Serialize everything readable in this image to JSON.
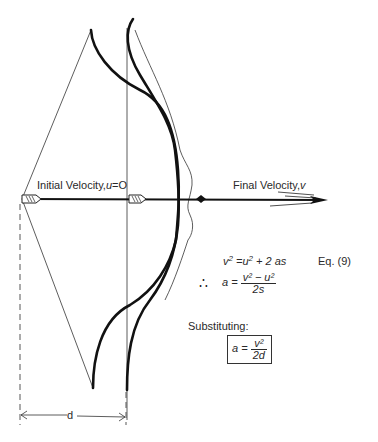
{
  "labels": {
    "initial_velocity": "Initial Velocity,",
    "initial_velocity_symbol": "u",
    "initial_velocity_value": "=O",
    "final_velocity": "Final Velocity,",
    "final_velocity_symbol": "v",
    "distance": "d",
    "substituting": "Substituting:"
  },
  "equations": {
    "eq1_lhs": "v",
    "eq1_rhs_u": "u",
    "eq1_rhs_rest": " + 2 as",
    "eq1_tag": "Eq. (9)",
    "therefore_symbol": "∴",
    "eq2_lhs": "a =",
    "eq2_num": "v² − u²",
    "eq2_den": "2s",
    "result_lhs": "a =",
    "result_num": "v²",
    "result_den": "2d"
  },
  "colors": {
    "ink": "#1a1a1a",
    "background": "#ffffff"
  }
}
